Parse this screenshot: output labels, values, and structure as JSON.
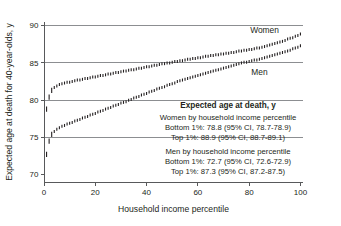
{
  "figure": {
    "source_credit": "DATA FROM CHETTY ET AL (2016). JOURNAL OF\nTHE AMERICAN MEDICAL ASSOCIATION."
  },
  "annotations": {
    "series_label_women": "Women",
    "series_label_men": "Men",
    "legend": {
      "header": "Expected age at death, y",
      "women_heading": "Women by household income percentile",
      "women_bottom": "Bottom 1%: 78.8 (95% CI, 78.7-78.9)",
      "women_top": "Top 1%: 88.9 (95% CI, 88.7-89.1)",
      "men_heading": "Men by household income percentile",
      "men_bottom": "Bottom 1%: 72.7 (95% CI, 72.6-72.9)",
      "men_top": "Top 1%: 87.3 (95% CI, 87.2-87.5)"
    }
  },
  "axis": {
    "y_ticks": [
      "70",
      "75",
      "80",
      "85",
      "90"
    ],
    "x_ticks": [
      "0",
      "20",
      "40",
      "60",
      "80",
      "100"
    ],
    "y_title": "Expected age at death for 40-year-olds, y",
    "x_title": "Household income percentile"
  },
  "colors": {
    "ink": "#231f20",
    "gridline": "#808285",
    "axis": "#58595b",
    "marker": "#231f20",
    "credit": "#a7a9ac",
    "background": "#ffffff"
  },
  "chart_data": {
    "type": "scatter",
    "title": "",
    "xlabel": "Household income percentile",
    "ylabel": "Expected age at death for 40-year-olds, y",
    "xlim": [
      0,
      101
    ],
    "ylim": [
      69,
      90.5
    ],
    "grid": "horizontal gridlines at 75, 80, 85, 90",
    "legend_position": "inside-lower-right",
    "marker_style": "short vertical tick (95% CI bar)",
    "series": [
      {
        "name": "Women",
        "label_position": "top-right",
        "x": [
          1,
          2,
          3,
          4,
          5,
          6,
          7,
          8,
          9,
          10,
          11,
          12,
          13,
          14,
          15,
          16,
          17,
          18,
          19,
          20,
          21,
          22,
          23,
          24,
          25,
          26,
          27,
          28,
          29,
          30,
          31,
          32,
          33,
          34,
          35,
          36,
          37,
          38,
          39,
          40,
          41,
          42,
          43,
          44,
          45,
          46,
          47,
          48,
          49,
          50,
          51,
          52,
          53,
          54,
          55,
          56,
          57,
          58,
          59,
          60,
          61,
          62,
          63,
          64,
          65,
          66,
          67,
          68,
          69,
          70,
          71,
          72,
          73,
          74,
          75,
          76,
          77,
          78,
          79,
          80,
          81,
          82,
          83,
          84,
          85,
          86,
          87,
          88,
          89,
          90,
          91,
          92,
          93,
          94,
          95,
          96,
          97,
          98,
          99,
          100
        ],
        "y": [
          78.8,
          80.4,
          81.3,
          81.7,
          81.9,
          82.1,
          82.2,
          82.3,
          82.4,
          82.4,
          82.5,
          82.6,
          82.7,
          82.7,
          82.8,
          82.9,
          82.9,
          83.0,
          83.1,
          83.1,
          83.2,
          83.3,
          83.3,
          83.4,
          83.5,
          83.5,
          83.6,
          83.7,
          83.7,
          83.8,
          83.9,
          83.9,
          84.0,
          84.1,
          84.1,
          84.2,
          84.3,
          84.3,
          84.4,
          84.5,
          84.5,
          84.6,
          84.7,
          84.7,
          84.8,
          84.9,
          84.9,
          85.0,
          85.0,
          85.1,
          85.2,
          85.2,
          85.3,
          85.3,
          85.4,
          85.5,
          85.5,
          85.6,
          85.6,
          85.7,
          85.7,
          85.8,
          85.9,
          85.9,
          86.0,
          86.0,
          86.1,
          86.1,
          86.2,
          86.2,
          86.3,
          86.3,
          86.4,
          86.4,
          86.5,
          86.6,
          86.6,
          86.7,
          86.7,
          86.8,
          86.8,
          86.9,
          87.0,
          87.0,
          87.1,
          87.2,
          87.3,
          87.4,
          87.5,
          87.6,
          87.7,
          87.8,
          87.9,
          88.0,
          88.2,
          88.3,
          88.4,
          88.6,
          88.7,
          88.9
        ]
      },
      {
        "name": "Men",
        "label_position": "bottom-right",
        "x": [
          1,
          2,
          3,
          4,
          5,
          6,
          7,
          8,
          9,
          10,
          11,
          12,
          13,
          14,
          15,
          16,
          17,
          18,
          19,
          20,
          21,
          22,
          23,
          24,
          25,
          26,
          27,
          28,
          29,
          30,
          31,
          32,
          33,
          34,
          35,
          36,
          37,
          38,
          39,
          40,
          41,
          42,
          43,
          44,
          45,
          46,
          47,
          48,
          49,
          50,
          51,
          52,
          53,
          54,
          55,
          56,
          57,
          58,
          59,
          60,
          61,
          62,
          63,
          64,
          65,
          66,
          67,
          68,
          69,
          70,
          71,
          72,
          73,
          74,
          75,
          76,
          77,
          78,
          79,
          80,
          81,
          82,
          83,
          84,
          85,
          86,
          87,
          88,
          89,
          90,
          91,
          92,
          93,
          94,
          95,
          96,
          97,
          98,
          99,
          100
        ],
        "y": [
          72.7,
          74.5,
          75.4,
          75.8,
          76.1,
          76.3,
          76.5,
          76.6,
          76.8,
          76.9,
          77.0,
          77.2,
          77.3,
          77.4,
          77.6,
          77.7,
          77.8,
          78.0,
          78.1,
          78.2,
          78.4,
          78.5,
          78.6,
          78.8,
          78.9,
          79.0,
          79.2,
          79.3,
          79.4,
          79.6,
          79.7,
          79.8,
          80.0,
          80.1,
          80.3,
          80.4,
          80.5,
          80.7,
          80.8,
          80.9,
          81.1,
          81.2,
          81.3,
          81.5,
          81.6,
          81.7,
          81.8,
          82.0,
          82.1,
          82.2,
          82.3,
          82.5,
          82.6,
          82.7,
          82.8,
          82.9,
          83.0,
          83.1,
          83.2,
          83.3,
          83.4,
          83.5,
          83.6,
          83.7,
          83.8,
          83.9,
          84.0,
          84.1,
          84.2,
          84.3,
          84.4,
          84.5,
          84.6,
          84.7,
          84.8,
          84.9,
          85.0,
          85.1,
          85.1,
          85.2,
          85.3,
          85.4,
          85.4,
          85.5,
          85.6,
          85.7,
          85.8,
          85.9,
          86.0,
          86.1,
          86.2,
          86.3,
          86.4,
          86.5,
          86.6,
          86.7,
          86.9,
          87.0,
          87.1,
          87.3
        ]
      }
    ]
  }
}
